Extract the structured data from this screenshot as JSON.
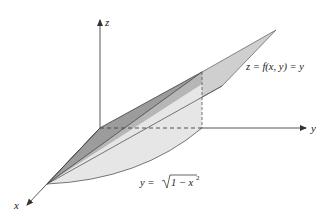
{
  "figure": {
    "axes": {
      "x_label": "x",
      "y_label": "y",
      "z_label": "z"
    },
    "annotations": {
      "surface_label": "z = f(x, y) = y",
      "curve_label_lhs": "y = ",
      "curve_label_radicand": "1 − x",
      "curve_label_exponent": "2"
    },
    "colors": {
      "axis": "#444444",
      "plane_fill": "#c8c8c8",
      "plane_edge": "#666666",
      "solid_dark": "#9a9a9a",
      "solid_mid": "#b0b0b0",
      "base_fill": "#ececec",
      "back_wall": "#a8a8a8"
    }
  }
}
